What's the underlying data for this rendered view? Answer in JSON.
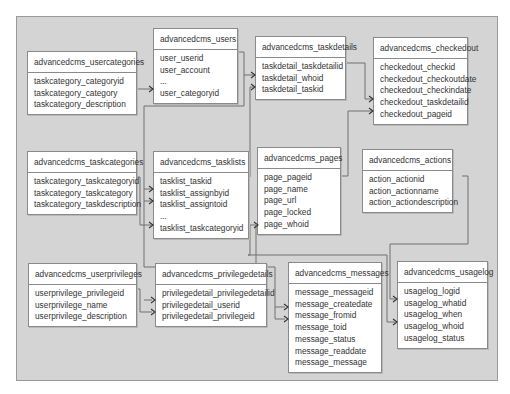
{
  "diagram": {
    "type": "database-schema",
    "tables": [
      {
        "id": "usercategories",
        "name": "advancedcms_usercategories",
        "fields": [
          "taskcategory_categoryid",
          "taskcategory_category",
          "taskcategory_description"
        ]
      },
      {
        "id": "users",
        "name": "advancedcms_users",
        "fields": [
          "user_userid",
          "user_account",
          "...",
          "user_categoryid"
        ]
      },
      {
        "id": "taskdetails",
        "name": "advancedcms_taskdetails",
        "fields": [
          "taskdetail_taskdetailid",
          "taskdetail_whoid",
          "taskdetail_taskid"
        ]
      },
      {
        "id": "checkedout",
        "name": "advancedcms_checkedout",
        "fields": [
          "checkedout_checkid",
          "checkedout_checkoutdate",
          "checkedout_checkindate",
          "checkedout_taskdetailid",
          "checkedout_pageid"
        ]
      },
      {
        "id": "taskcategories",
        "name": "advancedcms_taskcategories",
        "fields": [
          "taskcategory_taskcategoryid",
          "taskcategory_taskcategory",
          "taskcategory_taskdescription"
        ]
      },
      {
        "id": "tasklists",
        "name": "advancedcms_tasklists",
        "fields": [
          "tasklist_taskid",
          "tasklist_assignbyid",
          "tasklist_assigntoid",
          "...",
          "tasklist_taskcategoryid"
        ]
      },
      {
        "id": "pages",
        "name": "advancedcms_pages",
        "fields": [
          "page_pageid",
          "page_name",
          "page_url",
          "page_locked",
          "page_whoid"
        ]
      },
      {
        "id": "actions",
        "name": "advancedcms_actions",
        "fields": [
          "action_actionid",
          "action_actionname",
          "action_actiondescription"
        ]
      },
      {
        "id": "userprivileges",
        "name": "advancedcms_userprivileges",
        "fields": [
          "userprivilege_privilegeid",
          "userprivilege_name",
          "userprivilege_description"
        ]
      },
      {
        "id": "privilegedetails",
        "name": "advancedcms_privilegedetails",
        "fields": [
          "privilegedetail_privilegedetailid",
          "privilegedetail_userid",
          "privilegedetail_privilegeid"
        ]
      },
      {
        "id": "messages",
        "name": "advancedcms_messages",
        "fields": [
          "message_messageid",
          "message_createdate",
          "message_fromid",
          "message_toid",
          "message_status",
          "message_readdate",
          "message_message"
        ]
      },
      {
        "id": "usagelog",
        "name": "advancedcms_usagelog",
        "fields": [
          "usagelog_logid",
          "usagelog_whatid",
          "usagelog_when",
          "usagelog_whoid",
          "usagelog_status"
        ]
      }
    ],
    "relationships": [
      {
        "from": "advancedcms_usercategories.taskcategory_categoryid",
        "to": "advancedcms_users.user_categoryid"
      },
      {
        "from": "advancedcms_users.user_userid",
        "to": "advancedcms_taskdetails.taskdetail_whoid"
      },
      {
        "from": "advancedcms_tasklists.tasklist_taskid",
        "to": "advancedcms_taskdetails.taskdetail_taskid"
      },
      {
        "from": "advancedcms_taskdetails.taskdetail_taskdetailid",
        "to": "advancedcms_checkedout.checkedout_taskdetailid"
      },
      {
        "from": "advancedcms_pages.page_pageid",
        "to": "advancedcms_checkedout.checkedout_pageid"
      },
      {
        "from": "advancedcms_users.user_userid",
        "to": "advancedcms_tasklists.tasklist_assignbyid"
      },
      {
        "from": "advancedcms_users.user_userid",
        "to": "advancedcms_tasklists.tasklist_assigntoid"
      },
      {
        "from": "advancedcms_taskcategories.taskcategory_taskcategoryid",
        "to": "advancedcms_tasklists.tasklist_taskcategoryid"
      },
      {
        "from": "advancedcms_users.user_userid",
        "to": "advancedcms_pages.page_whoid"
      },
      {
        "from": "advancedcms_users.user_userid",
        "to": "advancedcms_privilegedetails.privilegedetail_userid"
      },
      {
        "from": "advancedcms_userprivileges.userprivilege_privilegeid",
        "to": "advancedcms_privilegedetails.privilegedetail_privilegeid"
      },
      {
        "from": "advancedcms_users.user_userid",
        "to": "advancedcms_messages.message_fromid"
      },
      {
        "from": "advancedcms_users.user_userid",
        "to": "advancedcms_messages.message_toid"
      },
      {
        "from": "advancedcms_actions.action_actionid",
        "to": "advancedcms_usagelog.usagelog_whatid"
      },
      {
        "from": "advancedcms_users.user_userid",
        "to": "advancedcms_usagelog.usagelog_whoid"
      }
    ],
    "colors": {
      "background": "#d4d4d4",
      "table": "#ffffff",
      "border": "#8a8a8a",
      "line": "#6a6a6a",
      "text": "#333333"
    }
  }
}
